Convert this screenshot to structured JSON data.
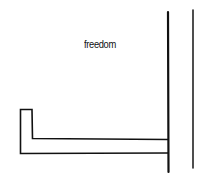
{
  "diagram": {
    "label": "freedom",
    "stroke_color": "#111111",
    "background": "#ffffff"
  }
}
